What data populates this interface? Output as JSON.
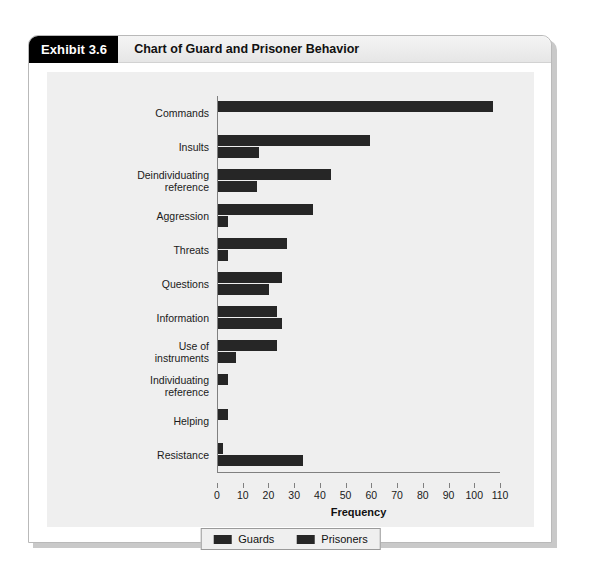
{
  "exhibit": {
    "tab_label": "Exhibit 3.6",
    "title": "Chart of Guard and Prisoner Behavior"
  },
  "legend": {
    "guards_label": "Guards",
    "prisoners_label": "Prisoners",
    "guards_swatch": "guards-swatch",
    "prisoners_swatch": "prisoners-swatch"
  },
  "chart_data": {
    "type": "bar",
    "orientation": "horizontal",
    "title": "Chart of Guard and Prisoner Behavior",
    "subtitle": "",
    "xlabel": "Frequency",
    "ylabel": "",
    "xlim": [
      0,
      110
    ],
    "xticks": [
      0,
      10,
      20,
      30,
      40,
      50,
      60,
      70,
      80,
      90,
      100,
      110
    ],
    "grid": false,
    "legend_position": "bottom-center",
    "categories": [
      "Commands",
      "Insults",
      "Deindividuating\nreference",
      "Aggression",
      "Threats",
      "Questions",
      "Information",
      "Use of\ninstruments",
      "Individuating\nreference",
      "Helping",
      "Resistance"
    ],
    "series": [
      {
        "name": "Guards",
        "color": "#262626",
        "values": [
          107,
          59,
          44,
          37,
          27,
          25,
          23,
          23,
          4,
          4,
          2
        ]
      },
      {
        "name": "Prisoners",
        "color": "#262626",
        "values": [
          0,
          16,
          15,
          4,
          4,
          20,
          25,
          7,
          0,
          0,
          33
        ]
      }
    ]
  }
}
